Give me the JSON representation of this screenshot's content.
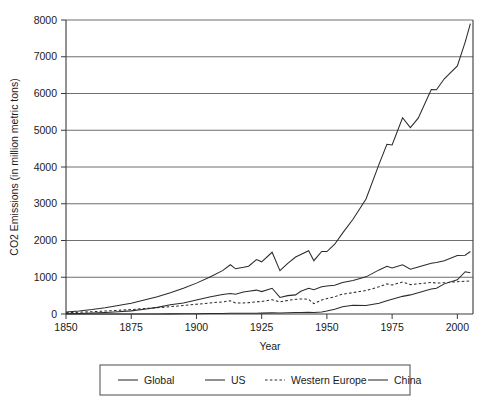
{
  "chart_data": {
    "type": "line",
    "title": "",
    "xlabel": "Year",
    "ylabel": "CO2 Emissions (in million metric tons)",
    "xlim": [
      1850,
      2006
    ],
    "ylim": [
      0,
      8000
    ],
    "grid": true,
    "legend_position": "below-axes",
    "xticks": [
      "1850",
      "1875",
      "1900",
      "1925",
      "1950",
      "1975",
      "2000"
    ],
    "xtick_values": [
      1850,
      1875,
      1900,
      1925,
      1950,
      1975,
      2000
    ],
    "yticks": [
      "0",
      "1000",
      "2000",
      "3000",
      "4000",
      "5000",
      "6000",
      "7000",
      "8000"
    ],
    "ytick_values": [
      0,
      1000,
      2000,
      3000,
      4000,
      5000,
      6000,
      7000,
      8000
    ],
    "x": [
      1850,
      1855,
      1860,
      1865,
      1870,
      1875,
      1880,
      1885,
      1890,
      1895,
      1900,
      1905,
      1910,
      1913,
      1915,
      1918,
      1920,
      1923,
      1925,
      1929,
      1932,
      1935,
      1938,
      1940,
      1943,
      1945,
      1948,
      1950,
      1953,
      1956,
      1960,
      1965,
      1970,
      1973,
      1975,
      1979,
      1982,
      1985,
      1990,
      1992,
      1995,
      2000,
      2003,
      2005
    ],
    "series": [
      {
        "name": "Global",
        "style": "solid",
        "color": "#2b2b2b",
        "values": [
          54,
          80,
          120,
          170,
          230,
          290,
          380,
          470,
          580,
          700,
          840,
          1000,
          1180,
          1340,
          1230,
          1270,
          1300,
          1480,
          1420,
          1680,
          1180,
          1380,
          1550,
          1620,
          1720,
          1450,
          1700,
          1700,
          1900,
          2200,
          2580,
          3130,
          4080,
          4620,
          4600,
          5340,
          5070,
          5330,
          6110,
          6100,
          6400,
          6750,
          7400,
          7900
        ]
      },
      {
        "name": "US",
        "style": "solid",
        "color": "#2b2b2b",
        "values": [
          8,
          14,
          25,
          40,
          60,
          85,
          130,
          180,
          250,
          300,
          380,
          460,
          530,
          560,
          540,
          600,
          620,
          650,
          610,
          700,
          450,
          500,
          520,
          620,
          700,
          660,
          740,
          760,
          780,
          860,
          910,
          1010,
          1200,
          1300,
          1250,
          1340,
          1220,
          1280,
          1380,
          1400,
          1450,
          1590,
          1600,
          1700
        ]
      },
      {
        "name": "Western Europe",
        "style": "dashed",
        "color": "#5a5a5a",
        "values": [
          35,
          48,
          62,
          80,
          100,
          120,
          148,
          170,
          200,
          230,
          265,
          300,
          330,
          360,
          300,
          300,
          310,
          330,
          340,
          390,
          330,
          370,
          400,
          410,
          400,
          280,
          380,
          420,
          470,
          540,
          580,
          640,
          740,
          820,
          790,
          870,
          800,
          820,
          860,
          840,
          850,
          880,
          890,
          900
        ]
      },
      {
        "name": "China",
        "style": "solid",
        "color": "#5a5a5a",
        "values": [
          0,
          0,
          0,
          0,
          0,
          0,
          0,
          2,
          4,
          6,
          8,
          12,
          16,
          20,
          18,
          18,
          20,
          22,
          24,
          30,
          28,
          32,
          38,
          42,
          46,
          40,
          55,
          80,
          130,
          200,
          240,
          230,
          290,
          360,
          400,
          480,
          520,
          580,
          680,
          700,
          820,
          930,
          1150,
          1120
        ]
      }
    ],
    "legend": [
      {
        "label": "Global",
        "style": "solid"
      },
      {
        "label": "US",
        "style": "solid"
      },
      {
        "label": "Western Europe",
        "style": "dashed"
      },
      {
        "label": "China",
        "style": "solid"
      }
    ]
  }
}
